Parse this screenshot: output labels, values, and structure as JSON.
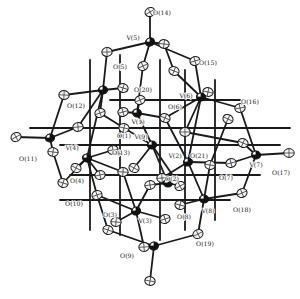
{
  "diagram": {
    "type": "ORTEP molecular structure",
    "colors": {
      "background": "#ffffff",
      "bond": "#1a1a1a",
      "vanadium": "#111111",
      "oxygen_fill": "#f4f4f4"
    },
    "labels": [
      {
        "id": "O14",
        "text": "O(14)",
        "x": 162,
        "y": 15
      },
      {
        "id": "V5",
        "text": "V(5)",
        "x": 133,
        "y": 40
      },
      {
        "id": "O5",
        "text": "O(5)",
        "x": 120,
        "y": 69
      },
      {
        "id": "O15",
        "text": "O(15)",
        "x": 208,
        "y": 65
      },
      {
        "id": "O20",
        "text": "O(20)",
        "x": 143,
        "y": 92
      },
      {
        "id": "V6",
        "text": "V(6)",
        "x": 186,
        "y": 98
      },
      {
        "id": "O6",
        "text": "O(6)",
        "x": 175,
        "y": 109
      },
      {
        "id": "O16",
        "text": "O(16)",
        "x": 250,
        "y": 104
      },
      {
        "id": "O12",
        "text": "O(12)",
        "x": 76,
        "y": 108
      },
      {
        "id": "V1",
        "text": "V(1)",
        "x": 138,
        "y": 124
      },
      {
        "id": "O1",
        "text": "O(1)",
        "x": 124,
        "y": 138
      },
      {
        "id": "V9",
        "text": "V(9)",
        "x": 141,
        "y": 139
      },
      {
        "id": "O13",
        "text": "O(13)",
        "x": 121,
        "y": 155
      },
      {
        "id": "V4",
        "text": "V(4)",
        "x": 72,
        "y": 150
      },
      {
        "id": "O11",
        "text": "O(11)",
        "x": 28,
        "y": 161
      },
      {
        "id": "V2",
        "text": "V(2)",
        "x": 175,
        "y": 158
      },
      {
        "id": "O21",
        "text": "O(21)",
        "x": 199,
        "y": 158
      },
      {
        "id": "V7",
        "text": "V(7)",
        "x": 256,
        "y": 167
      },
      {
        "id": "O17",
        "text": "O(17)",
        "x": 281,
        "y": 175
      },
      {
        "id": "O7",
        "text": "O(7)",
        "x": 226,
        "y": 180
      },
      {
        "id": "O2",
        "text": "O(2)",
        "x": 172,
        "y": 181
      },
      {
        "id": "O4",
        "text": "O(4)",
        "x": 77,
        "y": 183
      },
      {
        "id": "O10",
        "text": "O(10)",
        "x": 74,
        "y": 206
      },
      {
        "id": "O3",
        "text": "O(3)",
        "x": 110,
        "y": 217
      },
      {
        "id": "V3",
        "text": "V(3)",
        "x": 145,
        "y": 223
      },
      {
        "id": "O8",
        "text": "O(8)",
        "x": 184,
        "y": 219
      },
      {
        "id": "V8",
        "text": "V(8)",
        "x": 208,
        "y": 213
      },
      {
        "id": "O18",
        "text": "O(18)",
        "x": 242,
        "y": 212
      },
      {
        "id": "O19",
        "text": "O(19)",
        "x": 205,
        "y": 246
      },
      {
        "id": "O9",
        "text": "O(9)",
        "x": 127,
        "y": 258
      }
    ],
    "vanadium_atoms": [
      {
        "id": "V5",
        "x": 150,
        "y": 42
      },
      {
        "id": "V4_top",
        "x": 103,
        "y": 90
      },
      {
        "id": "V1",
        "x": 137,
        "y": 113
      },
      {
        "id": "V9",
        "x": 152,
        "y": 145
      },
      {
        "id": "V6",
        "x": 201,
        "y": 97
      },
      {
        "id": "V11",
        "x": 50,
        "y": 138
      },
      {
        "id": "V4",
        "x": 87,
        "y": 158
      },
      {
        "id": "V2",
        "x": 188,
        "y": 162
      },
      {
        "id": "V7",
        "x": 256,
        "y": 155
      },
      {
        "id": "V3",
        "x": 136,
        "y": 211
      },
      {
        "id": "V8",
        "x": 204,
        "y": 199
      },
      {
        "id": "Vb",
        "x": 154,
        "y": 246
      },
      {
        "id": "Vc",
        "x": 168,
        "y": 183
      }
    ],
    "oxygen_atoms": [
      {
        "x": 150,
        "y": 12
      },
      {
        "x": 164,
        "y": 44
      },
      {
        "x": 195,
        "y": 61
      },
      {
        "x": 174,
        "y": 71
      },
      {
        "x": 107,
        "y": 52
      },
      {
        "x": 143,
        "y": 66
      },
      {
        "x": 208,
        "y": 92
      },
      {
        "x": 240,
        "y": 108
      },
      {
        "x": 228,
        "y": 119
      },
      {
        "x": 64,
        "y": 95
      },
      {
        "x": 100,
        "y": 113
      },
      {
        "x": 123,
        "y": 88
      },
      {
        "x": 78,
        "y": 127
      },
      {
        "x": 16,
        "y": 137
      },
      {
        "x": 53,
        "y": 152
      },
      {
        "x": 123,
        "y": 112
      },
      {
        "x": 165,
        "y": 118
      },
      {
        "x": 185,
        "y": 132
      },
      {
        "x": 140,
        "y": 100
      },
      {
        "x": 124,
        "y": 128
      },
      {
        "x": 113,
        "y": 150
      },
      {
        "x": 76,
        "y": 168
      },
      {
        "x": 123,
        "y": 172
      },
      {
        "x": 97,
        "y": 195
      },
      {
        "x": 63,
        "y": 183
      },
      {
        "x": 162,
        "y": 178
      },
      {
        "x": 180,
        "y": 186
      },
      {
        "x": 210,
        "y": 165
      },
      {
        "x": 231,
        "y": 163
      },
      {
        "x": 243,
        "y": 143
      },
      {
        "x": 289,
        "y": 153
      },
      {
        "x": 242,
        "y": 193
      },
      {
        "x": 180,
        "y": 205
      },
      {
        "x": 150,
        "y": 185
      },
      {
        "x": 134,
        "y": 168
      },
      {
        "x": 116,
        "y": 222
      },
      {
        "x": 165,
        "y": 219
      },
      {
        "x": 108,
        "y": 230
      },
      {
        "x": 144,
        "y": 247
      },
      {
        "x": 198,
        "y": 234
      },
      {
        "x": 150,
        "y": 281
      },
      {
        "x": 100,
        "y": 175
      }
    ],
    "bonds": [
      [
        150,
        12,
        150,
        42
      ],
      [
        150,
        42,
        164,
        44
      ],
      [
        150,
        42,
        107,
        52
      ],
      [
        150,
        42,
        143,
        66
      ],
      [
        150,
        42,
        195,
        61
      ],
      [
        107,
        52,
        103,
        90
      ],
      [
        143,
        66,
        137,
        113
      ],
      [
        174,
        71,
        201,
        97
      ],
      [
        195,
        61,
        201,
        97
      ],
      [
        164,
        44,
        174,
        71
      ],
      [
        201,
        97,
        208,
        92
      ],
      [
        201,
        97,
        240,
        108
      ],
      [
        201,
        97,
        165,
        118
      ],
      [
        201,
        97,
        188,
        162
      ],
      [
        201,
        97,
        185,
        132
      ],
      [
        240,
        108,
        256,
        155
      ],
      [
        228,
        119,
        210,
        165
      ],
      [
        256,
        155,
        289,
        153
      ],
      [
        256,
        155,
        242,
        193
      ],
      [
        256,
        155,
        243,
        143
      ],
      [
        256,
        155,
        231,
        163
      ],
      [
        103,
        90,
        64,
        95
      ],
      [
        103,
        90,
        123,
        88
      ],
      [
        103,
        90,
        100,
        113
      ],
      [
        103,
        90,
        78,
        127
      ],
      [
        103,
        90,
        87,
        158
      ],
      [
        64,
        95,
        50,
        138
      ],
      [
        50,
        138,
        16,
        137
      ],
      [
        50,
        138,
        53,
        152
      ],
      [
        50,
        138,
        78,
        127
      ],
      [
        53,
        152,
        63,
        183
      ],
      [
        63,
        183,
        87,
        158
      ],
      [
        87,
        158,
        76,
        168
      ],
      [
        87,
        158,
        100,
        175
      ],
      [
        87,
        158,
        113,
        150
      ],
      [
        87,
        158,
        97,
        195
      ],
      [
        87,
        158,
        123,
        172
      ],
      [
        97,
        195,
        108,
        230
      ],
      [
        108,
        230,
        154,
        246
      ],
      [
        154,
        246,
        150,
        281
      ],
      [
        154,
        246,
        144,
        247
      ],
      [
        154,
        246,
        198,
        234
      ],
      [
        198,
        234,
        204,
        199
      ],
      [
        204,
        199,
        242,
        193
      ],
      [
        204,
        199,
        180,
        205
      ],
      [
        204,
        199,
        210,
        165
      ],
      [
        204,
        199,
        188,
        162
      ],
      [
        136,
        211,
        116,
        222
      ],
      [
        136,
        211,
        165,
        219
      ],
      [
        136,
        211,
        144,
        247
      ],
      [
        136,
        211,
        150,
        185
      ],
      [
        136,
        211,
        97,
        195
      ],
      [
        136,
        211,
        123,
        172
      ],
      [
        188,
        162,
        162,
        178
      ],
      [
        188,
        162,
        231,
        163
      ],
      [
        188,
        162,
        165,
        118
      ],
      [
        137,
        113,
        123,
        112
      ],
      [
        137,
        113,
        140,
        100
      ],
      [
        137,
        113,
        165,
        118
      ],
      [
        137,
        113,
        152,
        145
      ],
      [
        152,
        145,
        124,
        128
      ],
      [
        152,
        145,
        180,
        186
      ],
      [
        152,
        145,
        134,
        168
      ],
      [
        152,
        145,
        168,
        183
      ],
      [
        168,
        183,
        150,
        185
      ],
      [
        168,
        183,
        180,
        186
      ],
      [
        30,
        128,
        290,
        128
      ],
      [
        60,
        145,
        280,
        145
      ],
      [
        70,
        175,
        260,
        175
      ],
      [
        90,
        60,
        90,
        230
      ],
      [
        120,
        55,
        120,
        235
      ],
      [
        160,
        60,
        160,
        240
      ],
      [
        185,
        70,
        185,
        230
      ],
      [
        215,
        80,
        215,
        220
      ],
      [
        110,
        100,
        240,
        100
      ],
      [
        60,
        200,
        230,
        200
      ],
      [
        124,
        128,
        100,
        113
      ],
      [
        185,
        132,
        243,
        143
      ]
    ]
  }
}
